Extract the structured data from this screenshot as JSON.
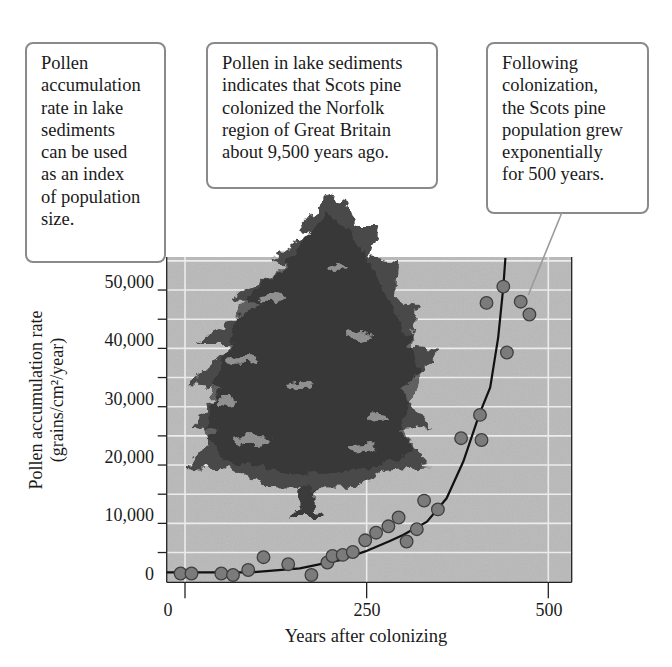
{
  "callouts": [
    {
      "lines": [
        "Pollen",
        "accumulation",
        "rate in lake",
        "sediments",
        "can be used",
        "as an index",
        "of population",
        "size."
      ]
    },
    {
      "lines": [
        "Pollen in lake sediments",
        "indicates that Scots pine",
        "colonized the Norfolk",
        "region of Great Britain",
        "about 9,500 years ago."
      ]
    },
    {
      "lines": [
        "Following",
        "colonization,",
        "the Scots pine",
        "population grew",
        "exponentially",
        "for 500 years."
      ]
    }
  ],
  "colors": {
    "plot_background": "#b9b9b9",
    "gridline": "#ececec",
    "point_fill": "#7b7b7b",
    "point_stroke": "#3f3f3f",
    "curve": "#111111",
    "callout_border": "#8a8a8a"
  },
  "chart_data": {
    "type": "scatter",
    "title": "",
    "xlabel": "Years after colonizing",
    "ylabel": "Pollen accumulation rate (grains/cm²/year)",
    "ylabel_lines": [
      "Pollen accumulation rate",
      "(grains/cm²/year)"
    ],
    "xlim": [
      -25,
      530
    ],
    "ylim": [
      0,
      55500
    ],
    "x_ticks": [
      0,
      250,
      500
    ],
    "x_tick_labels": [
      "0",
      "250",
      "500"
    ],
    "y_ticks": [
      0,
      10000,
      20000,
      30000,
      40000,
      50000
    ],
    "y_tick_labels": [
      "0",
      "10,000",
      "20,000",
      "30,000",
      "40,000",
      "50,000"
    ],
    "y_minor_ticks": [
      5000,
      15000,
      25000,
      35000,
      45000
    ],
    "grid": true,
    "background_image": "Scots pine tree illustration",
    "series": [
      {
        "name": "Observed pollen accumulation",
        "type": "scatter",
        "points": [
          {
            "x": -6,
            "y": 1400
          },
          {
            "x": 9,
            "y": 1400
          },
          {
            "x": 50,
            "y": 1400
          },
          {
            "x": 66,
            "y": 1150
          },
          {
            "x": 87,
            "y": 2000
          },
          {
            "x": 108,
            "y": 4200
          },
          {
            "x": 142,
            "y": 3000
          },
          {
            "x": 174,
            "y": 1150
          },
          {
            "x": 196,
            "y": 3300
          },
          {
            "x": 203,
            "y": 4400
          },
          {
            "x": 217,
            "y": 4600
          },
          {
            "x": 231,
            "y": 5100
          },
          {
            "x": 248,
            "y": 7100
          },
          {
            "x": 263,
            "y": 8400
          },
          {
            "x": 280,
            "y": 9500
          },
          {
            "x": 294,
            "y": 11000
          },
          {
            "x": 305,
            "y": 6900
          },
          {
            "x": 319,
            "y": 9000
          },
          {
            "x": 329,
            "y": 13900
          },
          {
            "x": 348,
            "y": 12400
          },
          {
            "x": 380,
            "y": 24600
          },
          {
            "x": 406,
            "y": 28600
          },
          {
            "x": 408,
            "y": 24300
          },
          {
            "x": 415,
            "y": 47800
          },
          {
            "x": 438,
            "y": 50600
          },
          {
            "x": 443,
            "y": 39300
          },
          {
            "x": 462,
            "y": 48000
          },
          {
            "x": 474,
            "y": 45800
          }
        ]
      },
      {
        "name": "Exponential fit",
        "type": "line",
        "points": [
          {
            "x": -25,
            "y": 1600
          },
          {
            "x": 90,
            "y": 1600
          },
          {
            "x": 158,
            "y": 2300
          },
          {
            "x": 213,
            "y": 3700
          },
          {
            "x": 248,
            "y": 5200
          },
          {
            "x": 282,
            "y": 7000
          },
          {
            "x": 300,
            "y": 8000
          },
          {
            "x": 333,
            "y": 10300
          },
          {
            "x": 360,
            "y": 14300
          },
          {
            "x": 383,
            "y": 20600
          },
          {
            "x": 405,
            "y": 28700
          },
          {
            "x": 420,
            "y": 33300
          },
          {
            "x": 431,
            "y": 41900
          },
          {
            "x": 438,
            "y": 50500
          },
          {
            "x": 441,
            "y": 55500
          }
        ]
      }
    ],
    "annotations": [
      "Pollen accumulation rate in lake sediments can be used as an index of population size.",
      "Pollen in lake sediments indicates that Scots pine colonized the Norfolk region of Great Britain about 9,500 years ago.",
      "Following colonization, the Scots pine population grew exponentially for 500 years."
    ]
  }
}
